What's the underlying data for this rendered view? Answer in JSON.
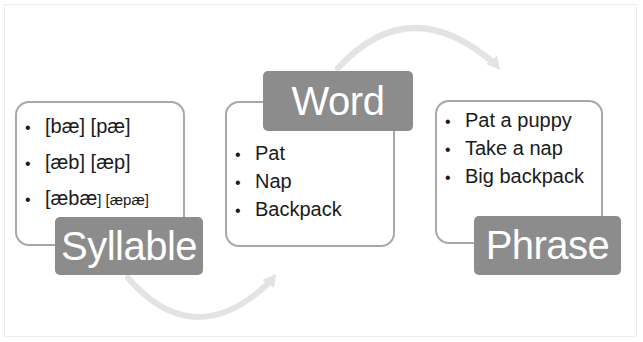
{
  "colors": {
    "label_bg": "#8c8c8c",
    "label_text": "#ffffff",
    "box_border": "#a8a8a8",
    "arrow": "#e3e3e3",
    "text": "#1a1a1a"
  },
  "stages": [
    {
      "label": "Syllable",
      "items": [
        {
          "main": "[bæ] [pæ]",
          "small": ""
        },
        {
          "main": "[æb] [æp]",
          "small": ""
        },
        {
          "main": "[æbæ",
          "small": "] [æpæ]"
        }
      ]
    },
    {
      "label": "Word",
      "items": [
        {
          "main": "Pat",
          "small": ""
        },
        {
          "main": "Nap",
          "small": ""
        },
        {
          "main": "Backpack",
          "small": ""
        }
      ]
    },
    {
      "label": "Phrase",
      "items": [
        {
          "main": "Pat a puppy",
          "small": ""
        },
        {
          "main": "Take a nap",
          "small": ""
        },
        {
          "main": "Big backpack",
          "small": ""
        }
      ]
    }
  ],
  "bullet": "•",
  "arrows": [
    {
      "from": "Syllable",
      "to": "Word",
      "direction": "curved-bottom"
    },
    {
      "from": "Word",
      "to": "Phrase",
      "direction": "curved-top"
    }
  ]
}
